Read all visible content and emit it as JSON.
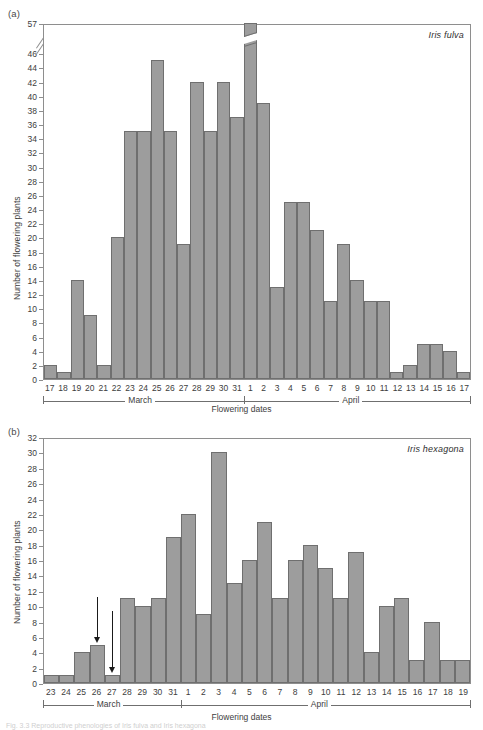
{
  "figure": {
    "caption_fragment": "Fig. 3.3 Reproductive phenologies of Iris fulva and Iris hexagona"
  },
  "panels": [
    {
      "letter": "(a)",
      "species": "Iris fulva",
      "ylabel": "Number of flowering plants",
      "xlabel": "Flowering dates",
      "months": [
        {
          "name": "March",
          "count": 15
        },
        {
          "name": "April",
          "count": 17
        }
      ]
    },
    {
      "letter": "(b)",
      "species": "Iris hexagona",
      "ylabel": "Number of flowering plants",
      "xlabel": "Flowering dates",
      "months": [
        {
          "name": "March",
          "count": 9
        },
        {
          "name": "April",
          "count": 19
        }
      ]
    }
  ],
  "colors": {
    "bar_fill": "#9d9d9d",
    "bar_stroke": "#6f6f6f",
    "axis": "#8e8e8e",
    "text": "#3d3d3d",
    "arrow": "#1a1a1a"
  },
  "chart_data": [
    {
      "type": "bar",
      "panel": "(a)",
      "title": "Iris fulva",
      "xlabel": "Flowering dates",
      "ylabel": "Number of flowering plants",
      "ylim": [
        0,
        46
      ],
      "y_axis_break": {
        "below": 46,
        "above": 57,
        "present": true
      },
      "yticks": [
        0,
        2,
        4,
        6,
        8,
        10,
        12,
        14,
        16,
        18,
        20,
        22,
        24,
        26,
        28,
        30,
        32,
        34,
        36,
        38,
        40,
        42,
        44,
        46,
        57
      ],
      "grid": false,
      "legend": "none",
      "categories": [
        "17",
        "18",
        "19",
        "20",
        "21",
        "22",
        "23",
        "24",
        "25",
        "26",
        "27",
        "28",
        "29",
        "30",
        "31",
        "1",
        "2",
        "3",
        "4",
        "5",
        "6",
        "7",
        "8",
        "9",
        "10",
        "11",
        "12",
        "13",
        "14",
        "15",
        "16",
        "17"
      ],
      "category_months": [
        "March",
        "March",
        "March",
        "March",
        "March",
        "March",
        "March",
        "March",
        "March",
        "March",
        "March",
        "March",
        "March",
        "March",
        "March",
        "April",
        "April",
        "April",
        "April",
        "April",
        "April",
        "April",
        "April",
        "April",
        "April",
        "April",
        "April",
        "April",
        "April",
        "April",
        "April",
        "April"
      ],
      "values": [
        2,
        1,
        14,
        9,
        2,
        20,
        35,
        35,
        45,
        35,
        19,
        42,
        35,
        42,
        37,
        57,
        39,
        13,
        25,
        25,
        21,
        11,
        19,
        14,
        11,
        11,
        1,
        2,
        5,
        5,
        4,
        1
      ],
      "annotations": []
    },
    {
      "type": "bar",
      "panel": "(b)",
      "title": "Iris hexagona",
      "xlabel": "Flowering dates",
      "ylabel": "Number of flowering plants",
      "ylim": [
        0,
        32
      ],
      "y_axis_break": {
        "present": false
      },
      "yticks": [
        0,
        2,
        4,
        6,
        8,
        10,
        12,
        14,
        16,
        18,
        20,
        22,
        24,
        26,
        28,
        30,
        32
      ],
      "grid": false,
      "legend": "none",
      "categories": [
        "23",
        "24",
        "25",
        "26",
        "27",
        "28",
        "29",
        "30",
        "31",
        "1",
        "2",
        "3",
        "4",
        "5",
        "6",
        "7",
        "8",
        "9",
        "10",
        "11",
        "12",
        "13",
        "14",
        "15",
        "16",
        "17",
        "18",
        "19"
      ],
      "category_months": [
        "March",
        "March",
        "March",
        "March",
        "March",
        "March",
        "March",
        "March",
        "March",
        "April",
        "April",
        "April",
        "April",
        "April",
        "April",
        "April",
        "April",
        "April",
        "April",
        "April",
        "April",
        "April",
        "April",
        "April",
        "April",
        "April",
        "April",
        "April"
      ],
      "values": [
        1,
        1,
        4,
        5,
        1,
        11,
        10,
        11,
        19,
        22,
        9,
        30,
        13,
        16,
        21,
        11,
        16,
        18,
        15,
        11,
        17,
        4,
        10,
        11,
        3,
        8,
        3,
        3
      ],
      "annotations": [
        {
          "type": "arrow",
          "direction": "down",
          "at_category": "26",
          "panel_month": "March"
        },
        {
          "type": "arrow",
          "direction": "down",
          "at_category": "27",
          "panel_month": "March"
        }
      ]
    }
  ]
}
